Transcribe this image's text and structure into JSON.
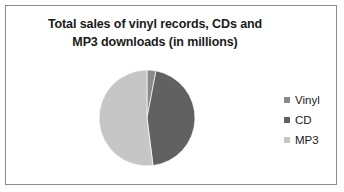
{
  "chart_data": {
    "type": "pie",
    "title": "Total sales of vinyl records, CDs and MP3 downloads (in millions)",
    "title_lines": [
      "Total sales of vinyl records, CDs and",
      "MP3 downloads  (in millions)"
    ],
    "categories": [
      "Vinyl",
      "CD",
      "MP3"
    ],
    "values": [
      3,
      45,
      52
    ],
    "unit": "millions",
    "colors": [
      "#8a8a8a",
      "#616161",
      "#c6c6c6"
    ],
    "legend_position": "right",
    "data_labels": false,
    "grid": false,
    "start_angle": 0,
    "direction": "clockwise",
    "slices": [
      {
        "label": "Vinyl",
        "value": 3,
        "color": "#8a8a8a"
      },
      {
        "label": "CD",
        "value": 45,
        "color": "#616161"
      },
      {
        "label": "MP3",
        "value": 52,
        "color": "#c6c6c6"
      }
    ]
  },
  "frame": {
    "border_color": "#8b8b8b",
    "background": "#ffffff"
  },
  "legend": {
    "entries": [
      {
        "label": "Vinyl",
        "color": "#8a8a8a"
      },
      {
        "label": "CD",
        "color": "#616161"
      },
      {
        "label": "MP3",
        "color": "#c6c6c6"
      }
    ]
  }
}
